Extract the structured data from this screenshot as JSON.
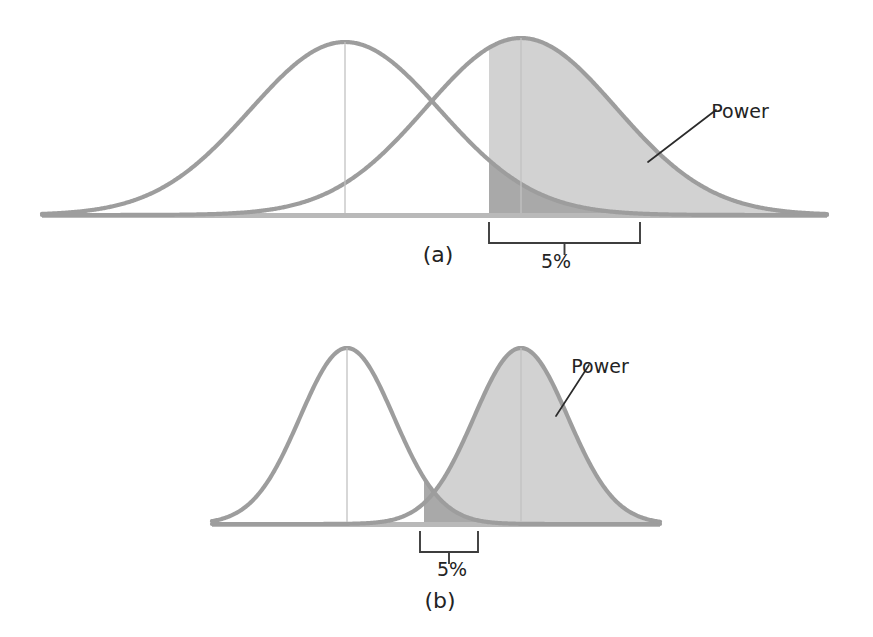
{
  "figure": {
    "background_color": "#ffffff",
    "width": 873,
    "height": 637
  },
  "style": {
    "curve_color": "#9d9d9d",
    "baseline_color": "#b9b9b9",
    "power_fill_color": "#d2d2d2",
    "alpha_fill_color": "#a9a9a9",
    "center_line_color": "#c2c2c2",
    "annotation_color": "#2b2b2b",
    "text_color": "#232323"
  },
  "panels": [
    {
      "id": "a",
      "caption": "(a)",
      "power_label": "Power",
      "alpha_label": "5%",
      "axis": {
        "x_start": 42,
        "x_end": 827,
        "y": 215
      },
      "null_curve": {
        "mean": 345,
        "sd": 95,
        "peak_y": 42,
        "center_line": true
      },
      "alt_curve": {
        "mean": 521,
        "sd": 95,
        "peak_y": 38,
        "center_line": true
      },
      "critical_value_x": 489,
      "bracket": {
        "x_left": 489,
        "x_right": 640,
        "y_top": 222,
        "y_bottom": 243,
        "tick_y": 255
      },
      "caption_pos": {
        "x": 438,
        "y": 262
      },
      "alpha_label_pos": {
        "x": 556,
        "y": 268
      },
      "power_label_pos": {
        "x": 740,
        "y": 118
      },
      "power_leader": {
        "x1": 648,
        "y1": 162,
        "x2": 716,
        "y2": 110
      }
    },
    {
      "id": "b",
      "caption": "(b)",
      "power_label": "Power",
      "alpha_label": "5%",
      "axis": {
        "x_start": 212,
        "x_end": 660,
        "y": 204
      },
      "null_curve": {
        "mean": 347,
        "sd": 47,
        "peak_y": 28,
        "center_line": true
      },
      "alt_curve": {
        "mean": 521,
        "sd": 47,
        "peak_y": 28,
        "center_line": true
      },
      "critical_value_x": 424,
      "bracket": {
        "x_left": 420,
        "x_right": 478,
        "y_top": 211,
        "y_bottom": 232,
        "tick_y": 244
      },
      "caption_pos": {
        "x": 440,
        "y": 288
      },
      "alpha_label_pos": {
        "x": 452,
        "y": 256
      },
      "power_label_pos": {
        "x": 600,
        "y": 53
      },
      "power_leader": {
        "x1": 556,
        "y1": 96,
        "x2": 589,
        "y2": 45
      }
    }
  ],
  "chart_data": {
    "type": "area",
    "xlabel": "",
    "ylabel": "",
    "grid": false,
    "legend": false,
    "annotations": [
      "Power",
      "5%",
      "(a)",
      "(b)"
    ],
    "panels": [
      {
        "panel": "(a)",
        "separation_note": "small mean separation, wide spread, low power",
        "series": [
          {
            "name": "Null distribution",
            "distribution": "normal",
            "mean": 345,
            "sd": 95,
            "shaded": false,
            "peak_x": 345
          },
          {
            "name": "Alternative distribution",
            "distribution": "normal",
            "mean": 521,
            "sd": 95,
            "shaded": true,
            "peak_x": 521
          }
        ],
        "critical_value_x": 489,
        "alpha": 0.05,
        "alpha_label": "5%",
        "power_region": "area under alternative curve right of critical value"
      },
      {
        "panel": "(b)",
        "separation_note": "large mean separation, narrow spread, high power",
        "series": [
          {
            "name": "Null distribution",
            "distribution": "normal",
            "mean": 347,
            "sd": 47,
            "shaded": false,
            "peak_x": 347
          },
          {
            "name": "Alternative distribution",
            "distribution": "normal",
            "mean": 521,
            "sd": 47,
            "shaded": true,
            "peak_x": 521
          }
        ],
        "critical_value_x": 424,
        "alpha": 0.05,
        "alpha_label": "5%",
        "power_region": "area under alternative curve right of critical value"
      }
    ]
  }
}
